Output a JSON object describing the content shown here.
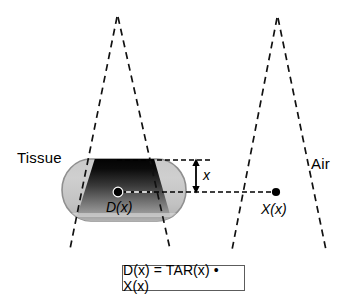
{
  "diagram": {
    "labels": {
      "tissue": "Tissue",
      "air": "Air",
      "dose_in_tissue": "D(x)",
      "exposure_in_air": "X(x)",
      "depth": "x"
    },
    "formula": {
      "text": "D(x) = TAR(x) • X(x)",
      "parts": {
        "dose": "D(x)",
        "equals": "=",
        "tar": "TAR(x)",
        "dot": "•",
        "exposure": "X(x)"
      }
    },
    "colors": {
      "stroke": "#000000",
      "background": "#ffffff",
      "phantom_light": "#cfcfcf",
      "phantom_mid": "#a8a8a8",
      "phantom_outline": "#8c8c8c",
      "beam_dark": "#000000",
      "beam_light": "#d8d8d8",
      "box_border": "#5c5c5c"
    },
    "elements": {
      "left_beam": "dashed-radiation-beam-in-tissue",
      "right_beam": "dashed-radiation-beam-in-air",
      "phantom": "rounded-tissue-phantom",
      "depth_arrow": "double-headed-depth-arrow",
      "top_reference_line": "dashed-surface-reference-line",
      "point_reference_line": "dashed-point-reference-line",
      "dose_point": "dose-measurement-point-dot",
      "exposure_point": "exposure-measurement-point-dot"
    }
  }
}
